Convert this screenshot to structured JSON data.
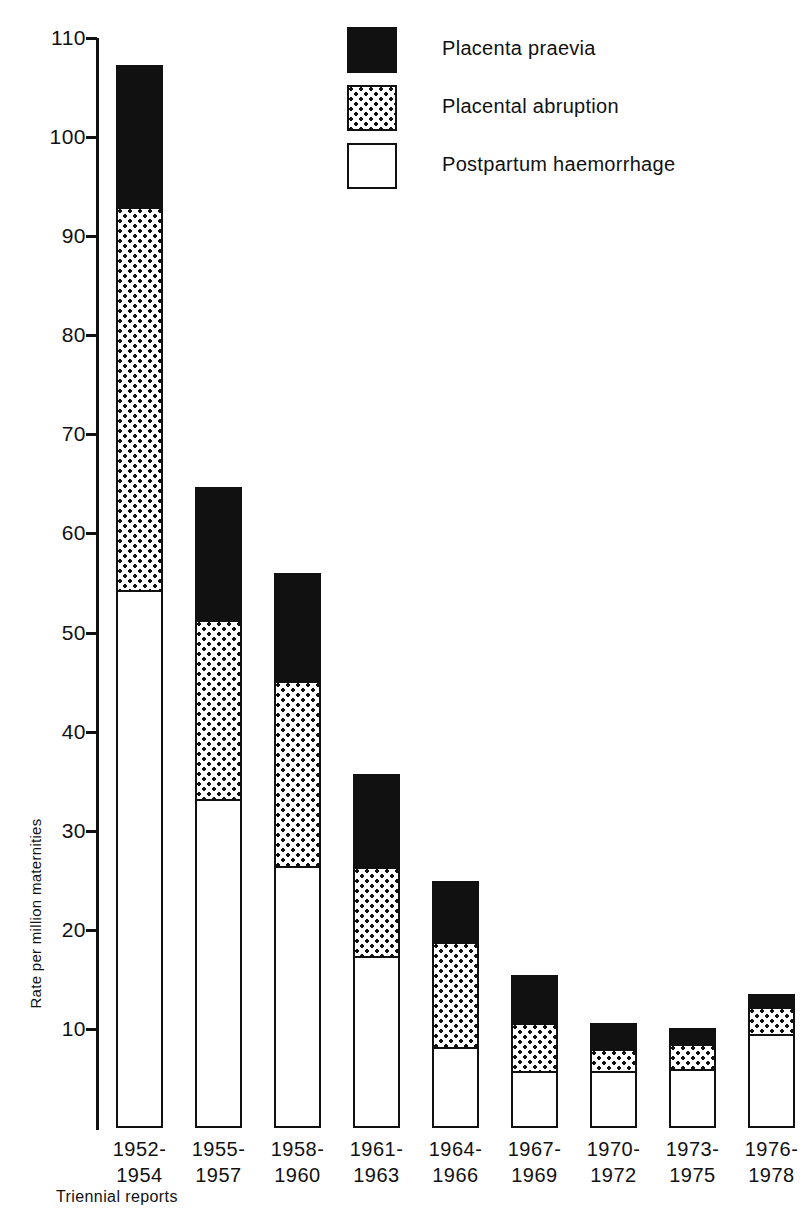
{
  "chart_data": {
    "type": "bar",
    "stacked": true,
    "title": "",
    "xlabel": "Triennial reports",
    "ylabel": "Rate per million maternities",
    "ylim": [
      0,
      110
    ],
    "yticks": [
      110,
      100,
      90,
      80,
      70,
      60,
      50,
      40,
      30,
      20,
      10
    ],
    "grid": false,
    "legend_position": "top-right",
    "categories": [
      "1952-\n1954",
      "1955-\n1957",
      "1958-\n1960",
      "1961-\n1963",
      "1964-\n1966",
      "1967-\n1969",
      "1970-\n1972",
      "1973-\n1975",
      "1976-\n1978"
    ],
    "category_lines": [
      [
        "1952-",
        "1954"
      ],
      [
        "1955-",
        "1957"
      ],
      [
        "1958-",
        "1960"
      ],
      [
        "1961-",
        "1963"
      ],
      [
        "1964-",
        "1966"
      ],
      [
        "1967-",
        "1969"
      ],
      [
        "1970-",
        "1972"
      ],
      [
        "1973-",
        "1975"
      ],
      [
        "1976-",
        "1978"
      ]
    ],
    "series": [
      {
        "name": "Postpartum haemorrhage",
        "key": "pph",
        "fill": "white",
        "values": [
          54.1,
          33.0,
          26.2,
          17.1,
          7.9,
          5.5,
          5.6,
          5.8,
          9.4
        ]
      },
      {
        "name": "Placental abruption",
        "key": "abruption",
        "fill": "dotted",
        "values": [
          39.0,
          18.4,
          19.0,
          9.3,
          11.0,
          5.2,
          2.5,
          2.8,
          3.0
        ]
      },
      {
        "name": "Placenta praevia",
        "key": "praevia",
        "fill": "black",
        "values": [
          14.2,
          13.3,
          10.8,
          9.3,
          6.0,
          4.7,
          2.5,
          1.5,
          1.1
        ]
      }
    ],
    "cumulative_tops": [
      {
        "pph": 54.1,
        "abruption": 93.1,
        "total": 107.3
      },
      {
        "pph": 33.0,
        "abruption": 51.4,
        "total": 64.7
      },
      {
        "pph": 26.2,
        "abruption": 45.2,
        "total": 56.0
      },
      {
        "pph": 17.1,
        "abruption": 26.4,
        "total": 35.7
      },
      {
        "pph": 7.9,
        "abruption": 18.9,
        "total": 24.9
      },
      {
        "pph": 5.5,
        "abruption": 10.7,
        "total": 15.4
      },
      {
        "pph": 5.6,
        "abruption": 8.1,
        "total": 10.6
      },
      {
        "pph": 5.8,
        "abruption": 8.6,
        "total": 10.1
      },
      {
        "pph": 9.4,
        "abruption": 12.4,
        "total": 13.5
      }
    ]
  },
  "legend": {
    "items": [
      {
        "label": "Placenta praevia",
        "swatch": "black-square-icon"
      },
      {
        "label": "Placental abruption",
        "swatch": "dotted-square-icon"
      },
      {
        "label": "Postpartum haemorrhage",
        "swatch": "white-square-icon"
      }
    ]
  },
  "axes": {
    "y_title": "Rate per million maternities",
    "x_title": "Triennial reports",
    "y_tick_labels": [
      "110",
      "100",
      "90",
      "80",
      "70",
      "60",
      "50",
      "40",
      "30",
      "20",
      "10"
    ]
  },
  "colors": {
    "ink": "#111111",
    "paper": "#ffffff"
  }
}
